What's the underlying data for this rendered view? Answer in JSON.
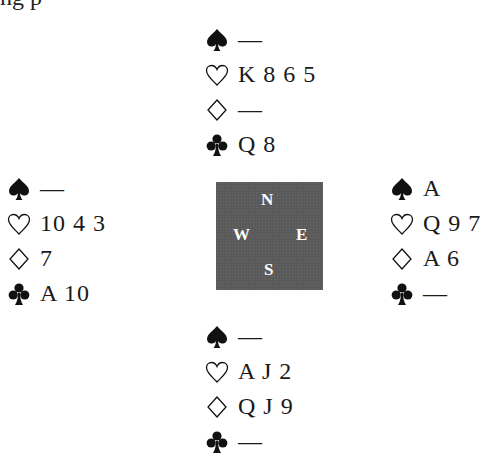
{
  "cutoff_text": "ng p",
  "compass": {
    "north": "N",
    "west": "W",
    "east": "E",
    "south": "S",
    "color": "#5a5a5a"
  },
  "hands": {
    "north": {
      "spades": "—",
      "hearts": "K 8 6 5",
      "diamonds": "—",
      "clubs": "Q 8"
    },
    "west": {
      "spades": "—",
      "hearts": "10 4 3",
      "diamonds": "7",
      "clubs": "A 10"
    },
    "east": {
      "spades": "A",
      "hearts": "Q 9 7",
      "diamonds": "A 6",
      "clubs": "—"
    },
    "south": {
      "spades": "—",
      "hearts": "A J 2",
      "diamonds": "Q J 9",
      "clubs": "—"
    }
  },
  "suit_icons": {
    "spades": "spade-icon",
    "hearts": "heart-icon",
    "diamonds": "diamond-icon",
    "clubs": "club-icon"
  }
}
